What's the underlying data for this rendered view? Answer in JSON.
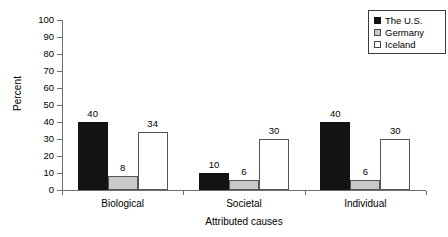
{
  "chart_data": {
    "type": "bar",
    "title": "",
    "xlabel": "Attributed causes",
    "ylabel": "Percent",
    "ylim": [
      0,
      100
    ],
    "ytick_step": 10,
    "yticks": [
      100,
      90,
      80,
      70,
      60,
      50,
      40,
      30,
      20,
      10,
      0
    ],
    "grid": false,
    "legend_position": "top-right",
    "categories": [
      "Biological",
      "Societal",
      "Individual"
    ],
    "series": [
      {
        "name": "The U.S.",
        "values": [
          40,
          10,
          40
        ],
        "color": "#131313",
        "style": "filled-black"
      },
      {
        "name": "Germany",
        "values": [
          8,
          6,
          6
        ],
        "color": "#c9c9c9",
        "style": "filled-light-gray"
      },
      {
        "name": "Iceland",
        "values": [
          34,
          30,
          30
        ],
        "color": "#ffffff",
        "style": "open-white"
      }
    ],
    "data_labels": [
      [
        "40",
        "8",
        "34"
      ],
      [
        "10",
        "6",
        "30"
      ],
      [
        "40",
        "6",
        "30"
      ]
    ]
  },
  "legend": {
    "items": [
      {
        "label": "The U.S.",
        "swatch": "filled-black-swatch"
      },
      {
        "label": "Germany",
        "swatch": "filled-gray-swatch"
      },
      {
        "label": "Iceland",
        "swatch": "open-white-swatch"
      }
    ]
  },
  "axes": {
    "y_title": "Percent",
    "x_title": "Attributed causes",
    "y_tick_labels": [
      "100",
      "90",
      "80",
      "70",
      "60",
      "50",
      "40",
      "30",
      "20",
      "10",
      "0"
    ],
    "x_tick_labels": [
      "Biological",
      "Societal",
      "Individual"
    ]
  }
}
